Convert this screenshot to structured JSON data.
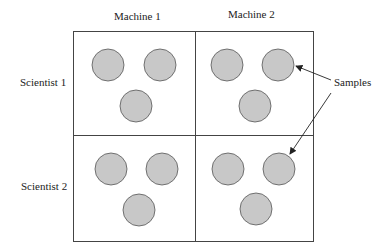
{
  "diagram": {
    "columns": [
      {
        "label": "Machine 1"
      },
      {
        "label": "Machine 2"
      }
    ],
    "rows": [
      {
        "label": "Scientist 1"
      },
      {
        "label": "Scientist 2"
      }
    ],
    "annotation": {
      "label": "Samples"
    },
    "colors": {
      "sample_fill": "#c8c8c8",
      "sample_stroke": "#555555",
      "grid_stroke": "#444444",
      "background": "#ffffff"
    },
    "samples_per_cell": 3
  }
}
